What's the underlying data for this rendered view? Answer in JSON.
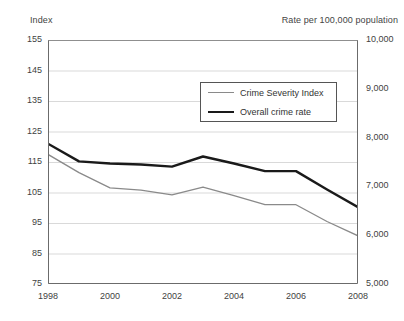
{
  "axis_titles": {
    "left": "Index",
    "right": "Rate per 100,000 population"
  },
  "legend": {
    "items": [
      {
        "label": "Crime Severity Index",
        "color": "#8a8a8a",
        "style": "thin"
      },
      {
        "label": "Overall crime rate",
        "color": "#1a1a1a",
        "style": "thick"
      }
    ]
  },
  "chart_data": {
    "type": "line",
    "title": "",
    "xlabel": "",
    "ylabel": "Index",
    "y2label": "Rate per 100,000 population",
    "grid": true,
    "legend_position": "inside-top-center",
    "x": [
      1998,
      1999,
      2000,
      2001,
      2002,
      2003,
      2004,
      2005,
      2006,
      2007,
      2008
    ],
    "x_tick_labels": [
      "1998",
      "",
      "2000",
      "",
      "2002",
      "",
      "2004",
      "",
      "2006",
      "",
      "2008"
    ],
    "xlim": [
      1998,
      2008
    ],
    "ylim": [
      75,
      155
    ],
    "y_ticks": [
      75,
      85,
      95,
      105,
      115,
      125,
      135,
      145,
      155
    ],
    "y_tick_labels": [
      "75",
      "85",
      "95",
      "105",
      "115",
      "125",
      "135",
      "145",
      "155"
    ],
    "y2lim": [
      5000,
      10000
    ],
    "y2_ticks": [
      5000,
      6000,
      7000,
      8000,
      9000,
      10000
    ],
    "y2_tick_labels": [
      "5,000",
      "6,000",
      "7,000",
      "8,000",
      "9,000",
      "10,000"
    ],
    "series": [
      {
        "name": "Overall crime rate",
        "color": "#1a1a1a",
        "width": 2.4,
        "axis": "right",
        "values": [
          121.0,
          115.2,
          114.5,
          114.2,
          113.5,
          116.8,
          114.5,
          112.0,
          112.0,
          106.0,
          100.2
        ],
        "values_rate": [
          7930,
          7570,
          7520,
          7500,
          7450,
          7660,
          7520,
          7360,
          7360,
          6980,
          6620
        ]
      },
      {
        "name": "Crime Severity Index",
        "color": "#8a8a8a",
        "width": 1.3,
        "axis": "left",
        "values": [
          117.5,
          111.5,
          106.5,
          105.8,
          104.2,
          106.8,
          104.0,
          101.0,
          101.0,
          95.5,
          90.8
        ]
      }
    ]
  }
}
